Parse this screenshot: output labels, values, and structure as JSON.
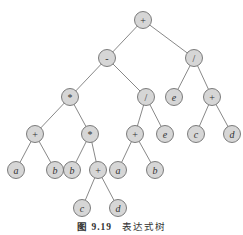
{
  "figure": {
    "caption_label": "图 9.19",
    "caption_title": "表达式树"
  },
  "tree": {
    "nodes": [
      {
        "id": "n0",
        "label": "+",
        "x": 143,
        "y": 20,
        "kind": "op"
      },
      {
        "id": "n1",
        "label": "-",
        "x": 107,
        "y": 58,
        "kind": "op"
      },
      {
        "id": "n2",
        "label": "/",
        "x": 194,
        "y": 58,
        "kind": "op"
      },
      {
        "id": "n3",
        "label": "*",
        "x": 70,
        "y": 97,
        "kind": "op"
      },
      {
        "id": "n4",
        "label": "/",
        "x": 146,
        "y": 97,
        "kind": "op"
      },
      {
        "id": "n5",
        "label": "e",
        "x": 174,
        "y": 97,
        "kind": "var"
      },
      {
        "id": "n6",
        "label": "+",
        "x": 212,
        "y": 97,
        "kind": "op"
      },
      {
        "id": "n7",
        "label": "+",
        "x": 35,
        "y": 134,
        "kind": "op"
      },
      {
        "id": "n8",
        "label": "*",
        "x": 90,
        "y": 134,
        "kind": "op"
      },
      {
        "id": "n9",
        "label": "+",
        "x": 135,
        "y": 134,
        "kind": "op"
      },
      {
        "id": "n10",
        "label": "e",
        "x": 165,
        "y": 134,
        "kind": "var"
      },
      {
        "id": "n11",
        "label": "c",
        "x": 196,
        "y": 134,
        "kind": "var"
      },
      {
        "id": "n12",
        "label": "d",
        "x": 232,
        "y": 134,
        "kind": "var"
      },
      {
        "id": "n13",
        "label": "a",
        "x": 16,
        "y": 170,
        "kind": "var"
      },
      {
        "id": "n14",
        "label": "b",
        "x": 55,
        "y": 170,
        "kind": "var"
      },
      {
        "id": "n15",
        "label": "b",
        "x": 72,
        "y": 170,
        "kind": "var"
      },
      {
        "id": "n16",
        "label": "+",
        "x": 98,
        "y": 170,
        "kind": "op"
      },
      {
        "id": "n17",
        "label": "a",
        "x": 118,
        "y": 170,
        "kind": "var"
      },
      {
        "id": "n18",
        "label": "b",
        "x": 155,
        "y": 170,
        "kind": "var"
      },
      {
        "id": "n19",
        "label": "c",
        "x": 82,
        "y": 208,
        "kind": "var"
      },
      {
        "id": "n20",
        "label": "d",
        "x": 118,
        "y": 208,
        "kind": "var"
      }
    ],
    "edges": [
      [
        "n0",
        "n1"
      ],
      [
        "n0",
        "n2"
      ],
      [
        "n1",
        "n3"
      ],
      [
        "n1",
        "n4"
      ],
      [
        "n2",
        "n5"
      ],
      [
        "n2",
        "n6"
      ],
      [
        "n3",
        "n7"
      ],
      [
        "n3",
        "n8"
      ],
      [
        "n4",
        "n9"
      ],
      [
        "n4",
        "n10"
      ],
      [
        "n6",
        "n11"
      ],
      [
        "n6",
        "n12"
      ],
      [
        "n7",
        "n13"
      ],
      [
        "n7",
        "n14"
      ],
      [
        "n8",
        "n15"
      ],
      [
        "n8",
        "n16"
      ],
      [
        "n9",
        "n17"
      ],
      [
        "n9",
        "n18"
      ],
      [
        "n16",
        "n19"
      ],
      [
        "n16",
        "n20"
      ]
    ],
    "node_radius": 8.5,
    "colors": {
      "node_fill": "#d6d6d6",
      "node_stroke": "#6e6e6e",
      "edge": "#7a7a7a"
    }
  }
}
